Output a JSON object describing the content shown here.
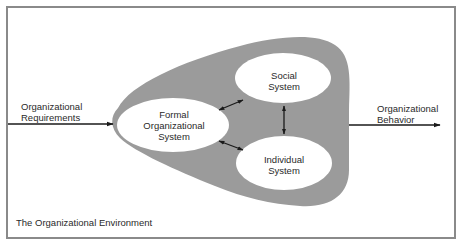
{
  "diagram": {
    "type": "systems-model",
    "colors": {
      "background": "#ffffff",
      "frame": "#8a8a8a",
      "environment_blob": "#9b9b9b",
      "system_ellipse": "#ffffff",
      "arrow": "#1a1a1a",
      "text": "#2a2a2a"
    },
    "input": {
      "label_line1": "Organizational",
      "label_line2": "Requirements"
    },
    "output": {
      "label_line1": "Organizational",
      "label_line2": "Behavior"
    },
    "environment_label": "The Organizational Environment",
    "systems": [
      {
        "id": "formal",
        "line1": "Formal",
        "line2": "Organizational",
        "line3": "System"
      },
      {
        "id": "social",
        "line1": "Social",
        "line2": "System"
      },
      {
        "id": "individual",
        "line1": "Individual",
        "line2": "System"
      }
    ],
    "connections": [
      {
        "from": "formal",
        "to": "social",
        "type": "bidirectional"
      },
      {
        "from": "formal",
        "to": "individual",
        "type": "bidirectional"
      },
      {
        "from": "social",
        "to": "individual",
        "type": "bidirectional"
      },
      {
        "from": "input",
        "to": "environment",
        "type": "directed"
      },
      {
        "from": "environment",
        "to": "output",
        "type": "directed"
      }
    ]
  }
}
